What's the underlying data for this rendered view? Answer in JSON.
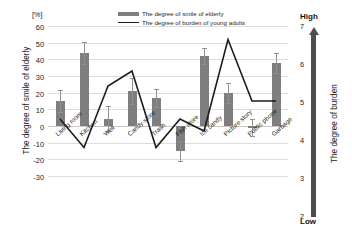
{
  "chart_data": {
    "type": "bar",
    "title": "",
    "xlabel": "",
    "ylabel": "The degree of smile of elderly",
    "y2label": "The degree of burden",
    "unit_label": "[%]",
    "ylim": [
      -30,
      60
    ],
    "y2lim": [
      2,
      7
    ],
    "yticks": [
      60,
      50,
      40,
      30,
      20,
      10,
      0,
      -10,
      -20,
      -30
    ],
    "y2ticks": [
      7,
      6,
      5,
      4,
      3,
      2
    ],
    "y2_high_label": "High",
    "y2_low_label": "Low",
    "grid": true,
    "legend_position": "top-center",
    "categories": [
      "Living room",
      "Kitchen",
      "Well",
      "Candy store",
      "Trash",
      "Fish store",
      "Ice candy",
      "Picture story",
      "Public phone",
      "Garbage"
    ],
    "series": [
      {
        "name": "The degree of smile of elderly",
        "type": "bar",
        "axis": "left",
        "color": "#7e7e7e",
        "values": [
          15,
          44,
          4.5,
          21,
          17,
          -15,
          42,
          20,
          -1,
          38
        ],
        "errors": [
          6.5,
          6.5,
          7.5,
          8,
          5.5,
          6,
          5,
          6,
          5,
          6
        ]
      },
      {
        "name": "The degree of burden of young adults",
        "type": "line",
        "axis": "right",
        "color": "#1c1c1c",
        "values": [
          3.9,
          2.95,
          5.0,
          5.5,
          2.95,
          3.9,
          3.5,
          6.55,
          4.5,
          4.5
        ]
      }
    ]
  },
  "legend": {
    "items": [
      {
        "label": "The degree of smile of elderly",
        "marker": "bar-swatch"
      },
      {
        "label": "The degree of burden of young adults",
        "marker": "line-swatch"
      }
    ]
  }
}
